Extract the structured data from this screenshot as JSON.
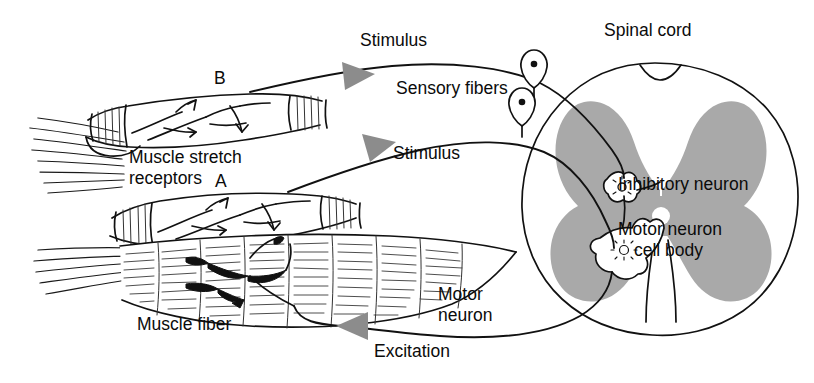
{
  "figure": {
    "title_visible": false,
    "background": "#ffffff",
    "ink_color": "#111111",
    "gray_matter_color": "#a9a9a9",
    "arrowhead_color": "#8c8c8c"
  },
  "labels": {
    "stimulus_top": "Stimulus",
    "stimulus_mid": "Stimulus",
    "sensory_fibers": "Sensory fibers",
    "spinal_cord": "Spinal cord",
    "inhibitory_neuron": "Inhibitory neuron",
    "motor_neuron_cell_body_line1": "Motor neuron",
    "motor_neuron_cell_body_line2": "cell body",
    "motor_neuron_line1": "Motor",
    "motor_neuron_line2": "neuron",
    "excitation": "Excitation",
    "muscle_stretch_line1": "Muscle stretch",
    "muscle_stretch_line2": "receptors",
    "muscle_fiber": "Muscle fiber",
    "spindle_b": "B",
    "spindle_a": "A"
  },
  "structures": {
    "spindle_upper": "muscle-spindle-B",
    "spindle_lower": "muscle-spindle-A",
    "muscle_fiber": "striated-extrafusal-muscle-fiber",
    "tendon": "tendon-fibers",
    "sensory_ganglion_cells": 2,
    "spinal_cord_features": [
      "gray-matter-butterfly",
      "dorsal-horn",
      "ventral-horn",
      "central-canal",
      "ventral-median-fissure",
      "white-matter"
    ],
    "neurons": [
      "inhibitory-interneuron",
      "motor-neuron-multipolar"
    ]
  }
}
